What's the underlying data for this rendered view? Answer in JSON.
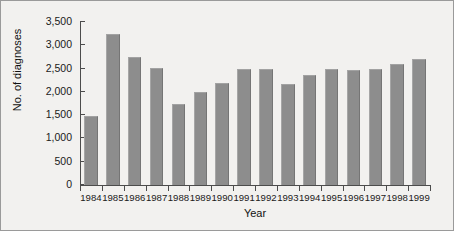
{
  "chart_data": {
    "type": "bar",
    "title": "",
    "xlabel": "Year",
    "ylabel": "No. of diagnoses",
    "categories": [
      "1984",
      "1985",
      "1986",
      "1987",
      "1988",
      "1989",
      "1990",
      "1991",
      "1992",
      "1993",
      "1994",
      "1995",
      "1996",
      "1997",
      "1998",
      "1999"
    ],
    "values": [
      1490,
      3240,
      2740,
      2520,
      1740,
      2000,
      2180,
      2500,
      2500,
      2160,
      2360,
      2500,
      2480,
      2500,
      2600,
      2710
    ],
    "ylim": [
      0,
      3500
    ],
    "yticks": [
      0,
      500,
      1000,
      1500,
      2000,
      2500,
      3000,
      3500
    ],
    "ytick_labels": [
      "0",
      "500",
      "1,000",
      "1,500",
      "2,000",
      "2,500",
      "3,000",
      "3,500"
    ],
    "grid": false,
    "legend": false,
    "bar_color": "#8d8d8d",
    "axis_color": "#4c4c4c",
    "background": "#f2f1ef"
  }
}
